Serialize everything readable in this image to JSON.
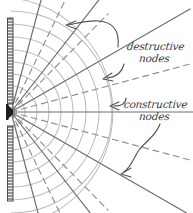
{
  "diagram": {
    "kind": "single-slit-wave-interference-sketch",
    "style": "hand-drawn pencil sketch on white paper",
    "canvas": {
      "width": 193,
      "height": 213
    },
    "source": {
      "name": "slit-aperture",
      "x": 11,
      "y": 112,
      "color": "#1d1d1d"
    },
    "barrier": {
      "name": "barrier-wall",
      "color": "#4a4a4a",
      "x": 8,
      "width": 5,
      "segments": [
        {
          "name": "upper-barrier",
          "y_top": 18,
          "y_bottom": 104
        },
        {
          "name": "lower-barrier",
          "y_top": 126,
          "y_bottom": 201
        }
      ]
    },
    "wavefronts": {
      "name": "circular-wavefronts",
      "color": "#b9b9b9",
      "count": 9,
      "radii": [
        14,
        26,
        38,
        50,
        62,
        75,
        88,
        101,
        115
      ],
      "description": "concentric semicircular arcs radiating right from the slit"
    },
    "constructive_rays": {
      "name": "constructive-node-rays",
      "stroke": "solid",
      "color": "#6f6f6f",
      "angles_deg": [
        -75,
        -52,
        -30,
        0,
        30,
        52,
        75
      ],
      "description": "solid radial lines marking constructive interference maxima"
    },
    "destructive_rays": {
      "name": "destructive-node-rays",
      "stroke": "dashed",
      "color": "#8a8a8a",
      "angles_deg": [
        -64,
        -41,
        -15,
        15,
        41,
        64
      ],
      "description": "dashed radial lines marking destructive interference minima"
    },
    "annotations": [
      {
        "id": "destructive",
        "name": "annotation-destructive-nodes",
        "line1": "destructive",
        "line2": "nodes",
        "arrows": [
          {
            "name": "arrow-destructive-upper",
            "points_to": "upper dashed ray",
            "tip_x": 66,
            "tip_y": 24
          },
          {
            "name": "arrow-destructive-lower",
            "points_to": "lower dashed ray",
            "tip_x": 103,
            "tip_y": 78
          }
        ]
      },
      {
        "id": "constructive",
        "name": "annotation-constructive-nodes",
        "line1": "constructive",
        "line2": "nodes",
        "arrows": [
          {
            "name": "arrow-constructive-center",
            "points_to": "horizontal center solid ray",
            "tip_x": 110,
            "tip_y": 105
          },
          {
            "name": "arrow-constructive-lower",
            "points_to": "lower solid ray",
            "tip_x": 120,
            "tip_y": 173
          }
        ]
      }
    ],
    "colors": {
      "paper": "#ffffff",
      "ink": "#3a3a3a",
      "arc": "#b9b9b9",
      "ray_solid": "#6f6f6f",
      "ray_dashed": "#8a8a8a",
      "barrier": "#4a4a4a",
      "arrow": "#555555"
    }
  }
}
